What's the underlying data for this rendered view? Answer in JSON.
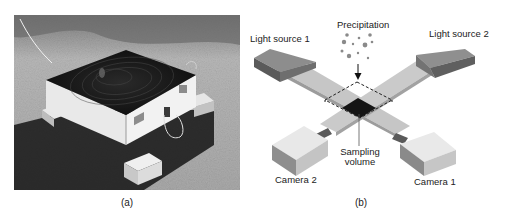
{
  "figure": {
    "panels": [
      {
        "id": "a",
        "caption": "(a)",
        "type": "photograph",
        "description": "Outdoor photo of box-shaped instrument with dark cable-covered top on asphalt"
      },
      {
        "id": "b",
        "caption": "(b)",
        "type": "schematic",
        "labels": {
          "precipitation": "Precipitation",
          "light_source_1": "Light source 1",
          "light_source_2": "Light source 2",
          "sampling_volume_line1": "Sampling",
          "sampling_volume_line2": "volume",
          "camera_2": "Camera 2",
          "camera_1": "Camera 1"
        }
      }
    ]
  },
  "colors": {
    "background": "#ffffff",
    "light_source_top": "#8a8a8a",
    "light_source_side": "#555555",
    "beam": "#c4c4c4",
    "camera_top": "#e6e6e6",
    "camera_side": "#9a9a9a",
    "sampling_volume": "#1a1a1a",
    "text": "#222222"
  }
}
